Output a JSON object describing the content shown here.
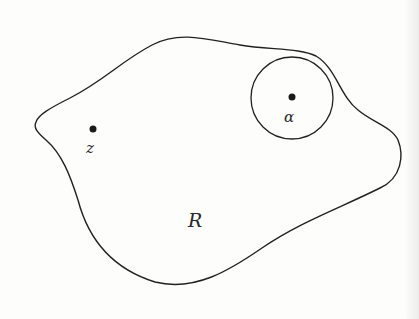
{
  "diagram": {
    "region_label": "R",
    "point_z": {
      "label": "z"
    },
    "point_alpha": {
      "label": "α"
    },
    "colors": {
      "stroke": "#222222",
      "background": "#fdfdfc"
    }
  }
}
